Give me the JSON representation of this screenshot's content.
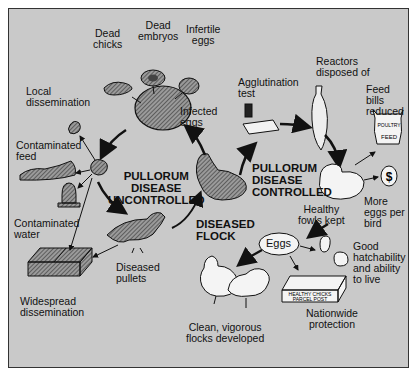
{
  "colors": {
    "background": "#c9c9c9",
    "ink": "#111111",
    "hatch": "#555555",
    "fowl_white": "#f4f4f4"
  },
  "center_labels": {
    "uncontrolled": "PULLORUM\nDISEASE\nUNCONTROLLED",
    "controlled": "PULLORUM\nDISEASE\nCONTROLLED",
    "diseased_flock": "DISEASED\nFLOCK"
  },
  "uncontrolled_cycle": {
    "dead_chicks": "Dead\nchicks",
    "dead_embryos": "Dead\nembryos",
    "infertile_eggs": "Infertile\neggs",
    "infected_eggs": "Infected\neggs",
    "local_dissemination": "Local\ndissemination",
    "contaminated_feed": "Contaminated\nfeed",
    "contaminated_water": "Contaminated\nwater",
    "widespread_dissemination": "Widespread\ndissemination",
    "diseased_pullets": "Diseased\npullets"
  },
  "controlled_cycle": {
    "agglutination_test": "Agglutination\ntest",
    "reactors_disposed": "Reactors\ndisposed of",
    "feed_bills_reduced": "Feed\nbills\nreduced",
    "more_eggs": "More\neggs per\nbird",
    "healthy_fowls_kept": "Healthy\nfowls kept",
    "eggs": "Eggs",
    "good_hatchability": "Good\nhatchability\nand ability\nto live",
    "nationwide_protection": "Nationwide\nprotection",
    "clean_flocks": "Clean, vigorous\nflocks developed"
  },
  "icon_text": {
    "feed_bag": "POULTRY\nFEED",
    "dollar": "$",
    "parcel_1": "HEALTHY",
    "parcel_2": "CHICKS",
    "parcel_3": "PARCEL",
    "parcel_4": "POST"
  }
}
